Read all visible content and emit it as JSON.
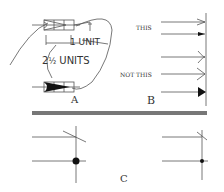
{
  "figure": {
    "panels": [
      {
        "id": "A",
        "label": "A",
        "annotations": [
          "1 UNIT",
          "2½ UNITS"
        ],
        "description": "Arrowhead proportions: open and filled arrowheads drawn within a grid"
      },
      {
        "id": "B",
        "label": "B",
        "annotations": [
          "THIS",
          "NOT THIS"
        ],
        "description": "Correct vs incorrect arrowhead styles terminating at a line"
      },
      {
        "id": "C",
        "label": "C",
        "description": "Tick mark and dot terminators at line intersections"
      }
    ],
    "text": {
      "one_unit": "1 UNIT",
      "two_half_units_prefix": "2",
      "two_half_units_frac": "½",
      "two_half_units_suffix": " UNITS",
      "this": "THIS",
      "not_this": "NOT THIS",
      "label_a": "A",
      "label_b": "B",
      "label_c": "C"
    },
    "colors": {
      "line": "#555555",
      "divider": "#777777",
      "fill": "#111111"
    }
  }
}
